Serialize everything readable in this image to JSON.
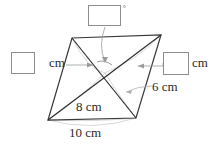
{
  "figure": {
    "kind": "quadrilateral-with-diagonals",
    "units": "cm",
    "degree_symbol": "°",
    "labels": {
      "left_unit": "cm",
      "right_unit": "cm",
      "diagonal_short": "6 cm",
      "diagonal_long": "8 cm",
      "base": "10 cm"
    },
    "answer_boxes": [
      {
        "id": "angle-box",
        "value": "",
        "suffix": "°",
        "position": "top"
      },
      {
        "id": "left-length-box",
        "value": "",
        "suffix": "cm",
        "position": "left"
      },
      {
        "id": "right-length-box",
        "value": "",
        "suffix": "cm",
        "position": "right"
      }
    ],
    "colors": {
      "outline": "#3a3a3a",
      "diagonal": "#2f2f2f",
      "leader": "#9a9a9a",
      "guide": "#c2c2c2",
      "box_border": "#8d8d8d",
      "text": "#2a2a2a",
      "background": "#ffffff"
    },
    "geometry": {
      "vertex_top_left": [
        72,
        38
      ],
      "vertex_top_right": [
        161,
        35
      ],
      "vertex_bottom_right": [
        136,
        118
      ],
      "vertex_bottom_left": [
        48,
        120
      ],
      "center": [
        105,
        73
      ]
    }
  }
}
